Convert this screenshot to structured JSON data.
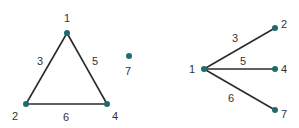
{
  "colors": {
    "node": "#1f6b6b",
    "edge": "#2b2b2b",
    "label": "#333333"
  },
  "graphs": [
    {
      "name": "triangle-graph",
      "nodes": [
        {
          "id": "1",
          "label": "1",
          "x": 67,
          "y": 33,
          "lx": 67,
          "ly": 22
        },
        {
          "id": "2",
          "label": "2",
          "x": 26,
          "y": 104,
          "lx": 15,
          "ly": 120
        },
        {
          "id": "4",
          "label": "4",
          "x": 107,
          "y": 104,
          "lx": 115,
          "ly": 120
        },
        {
          "id": "7",
          "label": "7",
          "x": 129,
          "y": 56,
          "lx": 128,
          "ly": 75
        }
      ],
      "edges": [
        {
          "from": "1",
          "to": "2",
          "weight": "3",
          "lx": 40,
          "ly": 65
        },
        {
          "from": "1",
          "to": "4",
          "weight": "5",
          "lx": 95,
          "ly": 65
        },
        {
          "from": "2",
          "to": "4",
          "weight": "6",
          "lx": 66,
          "ly": 121
        }
      ]
    },
    {
      "name": "star-graph",
      "nodes": [
        {
          "id": "1",
          "label": "1",
          "x": 204,
          "y": 69,
          "lx": 192,
          "ly": 73
        },
        {
          "id": "2",
          "label": "2",
          "x": 275,
          "y": 28,
          "lx": 284,
          "ly": 28
        },
        {
          "id": "4",
          "label": "4",
          "x": 275,
          "y": 69,
          "lx": 284,
          "ly": 73
        },
        {
          "id": "7",
          "label": "7",
          "x": 275,
          "y": 110,
          "lx": 284,
          "ly": 118
        }
      ],
      "edges": [
        {
          "from": "1",
          "to": "2",
          "weight": "3",
          "lx": 235,
          "ly": 42
        },
        {
          "from": "1",
          "to": "4",
          "weight": "5",
          "lx": 243,
          "ly": 65
        },
        {
          "from": "1",
          "to": "7",
          "weight": "6",
          "lx": 231,
          "ly": 102
        }
      ]
    }
  ]
}
